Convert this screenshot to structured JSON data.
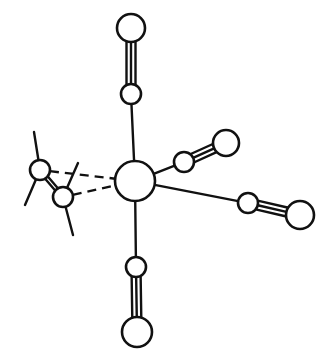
{
  "figure": {
    "stroke_color": "#111111",
    "background": "#ffffff"
  },
  "atoms": {
    "metal": {
      "cx": 135,
      "cy": 181,
      "r": 20
    },
    "carbonyls": [
      {
        "name": "top",
        "c": {
          "cx": 131,
          "cy": 94,
          "r": 10
        },
        "o": {
          "cx": 131,
          "cy": 28,
          "r": 14
        }
      },
      {
        "name": "upper-right",
        "c": {
          "cx": 184,
          "cy": 162,
          "r": 10
        },
        "o": {
          "cx": 226,
          "cy": 143,
          "r": 13
        }
      },
      {
        "name": "lower-right",
        "c": {
          "cx": 248,
          "cy": 203,
          "r": 10
        },
        "o": {
          "cx": 300,
          "cy": 215,
          "r": 14
        }
      },
      {
        "name": "bottom",
        "c": {
          "cx": 136,
          "cy": 267,
          "r": 10
        },
        "o": {
          "cx": 137,
          "cy": 332,
          "r": 15
        }
      }
    ],
    "ethylene": [
      {
        "cx": 40,
        "cy": 170,
        "r": 10,
        "subs": [
          [
            34,
            132
          ],
          [
            25,
            205
          ]
        ]
      },
      {
        "cx": 63,
        "cy": 197,
        "r": 10,
        "subs": [
          [
            78,
            163
          ],
          [
            73,
            235
          ]
        ]
      }
    ]
  },
  "bond_types": {
    "metal_carbon": "single",
    "carbon_oxygen": "triple",
    "metal_ethylene": "dashed",
    "ethylene_cc": "double"
  }
}
